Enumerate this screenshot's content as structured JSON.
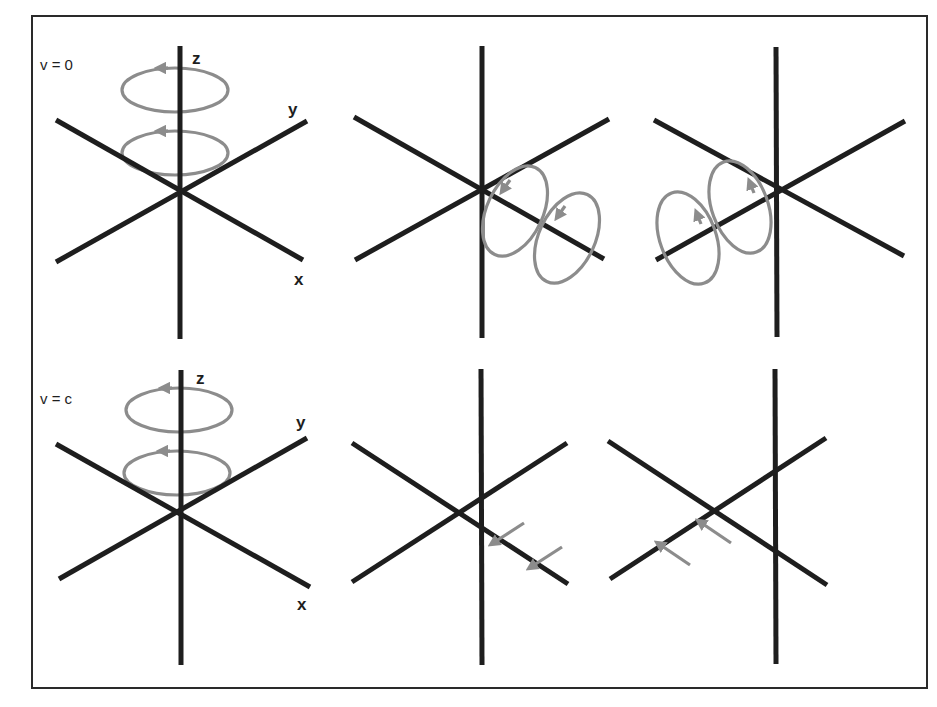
{
  "figure": {
    "frame_color": "#2a2a2a",
    "axis_color": "#1e1e1e",
    "vector_color": "#8c8c8c",
    "rows": [
      {
        "label": "v = 0",
        "axis_labels": {
          "z": "z",
          "y": "y",
          "x": "x"
        },
        "panels": [
          {
            "name": "z-polarized",
            "depiction": "two horizontal circular loops around z axis"
          },
          {
            "name": "x-polarized",
            "depiction": "two tilted loops along x axis"
          },
          {
            "name": "y-polarized",
            "depiction": "two tilted loops along y axis"
          }
        ]
      },
      {
        "label": "v = c",
        "axis_labels": {
          "z": "z",
          "y": "y",
          "x": "x"
        },
        "panels": [
          {
            "name": "z-polarized",
            "depiction": "two horizontal circular loops around z axis"
          },
          {
            "name": "x-polarized",
            "depiction": "two straight arrows parallel to x axis"
          },
          {
            "name": "y-polarized",
            "depiction": "two straight arrows parallel to y axis"
          }
        ]
      }
    ]
  }
}
